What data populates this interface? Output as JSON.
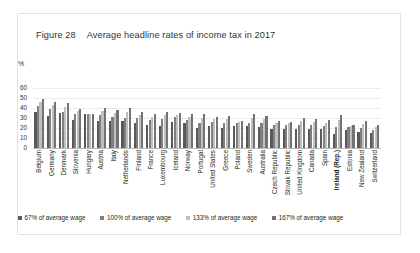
{
  "figure": {
    "number": "Figure 28",
    "title": "Average headline rates of income tax in 2017"
  },
  "axis": {
    "unit_label": "%"
  },
  "colors": {
    "series_67": "#595959",
    "series_100": "#808080",
    "series_133": "#bfbfbf",
    "series_167": "#737373",
    "gridline": "#ececec",
    "baseline": "#b9b9b9",
    "panel_border": "#e2e2e2",
    "text": "#231f20"
  },
  "highlighted_category": "Ireland (Rep.)",
  "chart_data": {
    "type": "bar",
    "title": "Average headline rates of income tax in 2017",
    "xlabel": "",
    "ylabel": "%",
    "ylim": [
      0,
      60
    ],
    "yticks": [
      0,
      10,
      20,
      30,
      40,
      50,
      60
    ],
    "grid": true,
    "legend_position": "bottom",
    "categories": [
      "Belgium",
      "Germany",
      "Denmark",
      "Slovenia",
      "Hungary",
      "Austria",
      "Italy",
      "Netherlands",
      "Finland",
      "France",
      "Luxembourg",
      "Iceland",
      "Norway",
      "Portugal",
      "United States",
      "Greece",
      "Poland",
      "Sweden",
      "Australia",
      "Czech Republic",
      "Slovak Republic",
      "United Kingdom",
      "Canada",
      "Spain",
      "Ireland (Rep.)",
      "Estonia",
      "New Zealand",
      "Switzerland"
    ],
    "series": [
      {
        "name": "67% of average wage",
        "color": "#595959",
        "values": [
          36,
          32,
          35,
          28,
          34,
          27,
          27,
          27,
          25,
          23,
          22,
          26,
          25,
          20,
          22,
          20,
          22,
          22,
          21,
          19,
          19,
          19,
          19,
          19,
          14,
          18,
          16,
          15
        ]
      },
      {
        "name": "100% of average wage",
        "color": "#808080",
        "values": [
          42,
          39,
          36,
          34,
          34,
          33,
          31,
          30,
          30,
          28,
          29,
          31,
          28,
          25,
          26,
          25,
          25,
          25,
          25,
          23,
          23,
          23,
          23,
          22,
          21,
          21,
          20,
          18
        ]
      },
      {
        "name": "133% of average wage",
        "color": "#bfbfbf",
        "values": [
          46,
          43,
          41,
          37,
          34,
          37,
          35,
          36,
          33,
          31,
          33,
          33,
          31,
          30,
          29,
          29,
          26,
          30,
          29,
          25,
          25,
          27,
          26,
          25,
          28,
          22,
          24,
          21
        ]
      },
      {
        "name": "167% of average wage",
        "color": "#737373",
        "values": [
          49,
          46,
          45,
          39,
          34,
          40,
          38,
          40,
          36,
          34,
          36,
          35,
          34,
          34,
          31,
          32,
          27,
          34,
          32,
          27,
          26,
          30,
          29,
          28,
          33,
          23,
          27,
          23
        ]
      }
    ]
  }
}
